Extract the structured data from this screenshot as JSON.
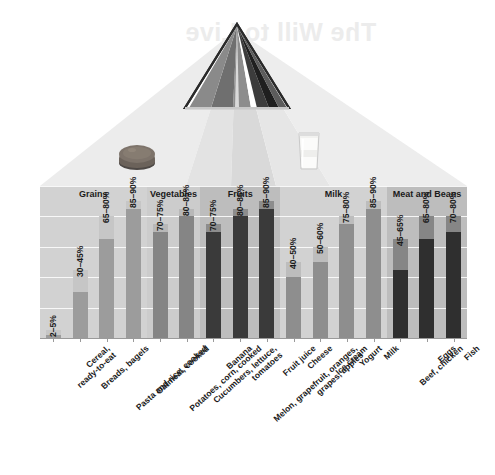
{
  "watermark_text": "The Will to Live",
  "graphic": {
    "pyramid_name": "mypyramid-food-guide-icon",
    "bagel_photo_name": "bagel-photo",
    "milk_photo_name": "glass-of-milk-photo",
    "pyramid_stripes": [
      "#7a7a7a",
      "#8f8f8f",
      "#c9c9c9",
      "#6e6e6e",
      "#ffffff",
      "#4a4a4a",
      "#2b2b2b",
      "#8b8b8b"
    ]
  },
  "chart_data": {
    "type": "bar",
    "title": "",
    "subtitle": "",
    "xlabel": "",
    "ylabel": "Percentage of Water by Weight",
    "ylim": [
      0,
      100
    ],
    "grid": true,
    "gridlines": [
      20,
      40,
      60,
      80,
      100
    ],
    "legend_position": "none",
    "bar_style": "range-bar (dark lower segment = low value, light upper segment = range span)",
    "groups": [
      {
        "label": "Grains",
        "band_color": "#d2d2d2",
        "bar_color": "#9c9c9c",
        "items": [
          {
            "label": "Cereal,\nready-to-eat",
            "range_label": "2–5%",
            "low": 2,
            "high": 5
          },
          {
            "label": "Breads, bagels",
            "range_label": "30–45%",
            "low": 30,
            "high": 45
          },
          {
            "label": "Pasta and rice, cooked",
            "range_label": "65–80%",
            "low": 65,
            "high": 80
          },
          {
            "label": "Oatmeal, cooked",
            "range_label": "85–90%",
            "low": 85,
            "high": 90
          }
        ]
      },
      {
        "label": "Vegetables",
        "band_color": "#cccccc",
        "bar_color": "#858585",
        "items": [
          {
            "label": "Potatoes, corn, cooked",
            "range_label": "70–75%",
            "low": 70,
            "high": 75
          },
          {
            "label": "Cucumbers, lettuce,\ntomatoes",
            "range_label": "80–85%",
            "low": 80,
            "high": 85
          }
        ]
      },
      {
        "label": "Fruits",
        "band_color": "#bdbdbd",
        "bar_color": "#3a3a3a",
        "items": [
          {
            "label": "Banana",
            "range_label": "70–75%",
            "low": 70,
            "high": 75
          },
          {
            "label": "Melon, grapefruit, oranges,\ngrapes, apples",
            "range_label": "80–85%",
            "low": 80,
            "high": 85
          },
          {
            "label": "Fruit juice",
            "range_label": "85–90%",
            "low": 85,
            "high": 90
          }
        ]
      },
      {
        "label": "Milk",
        "band_color": "#d2d2d2",
        "bar_color": "#8e8e8e",
        "items": [
          {
            "label": "Cheese",
            "range_label": "40–50%",
            "low": 40,
            "high": 50
          },
          {
            "label": "Ice cream",
            "range_label": "50–60%",
            "low": 50,
            "high": 60
          },
          {
            "label": "Yogurt",
            "range_label": "75–80%",
            "low": 75,
            "high": 80
          },
          {
            "label": "Milk",
            "range_label": "85–90%",
            "low": 85,
            "high": 90
          }
        ]
      },
      {
        "label": "Meat and Beans",
        "band_color": "#bdbdbd",
        "bar_color": "#2f2f2f",
        "items": [
          {
            "label": "Beef, chicken",
            "range_label": "45–65%",
            "low": 45,
            "high": 65
          },
          {
            "label": "Eggs",
            "range_label": "65–80%",
            "low": 65,
            "high": 80
          },
          {
            "label": "Fish",
            "range_label": "70–80%",
            "low": 70,
            "high": 80
          }
        ]
      }
    ]
  }
}
